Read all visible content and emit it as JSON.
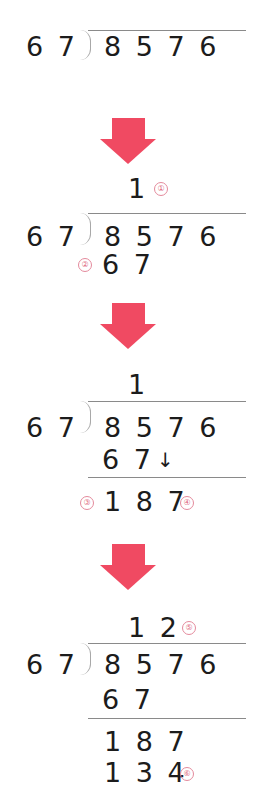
{
  "colors": {
    "arrow": "#f04a62",
    "marker": "#e06a82",
    "text": "#1c1c1c",
    "rule": "#8a8a8a"
  },
  "steps": [
    {
      "divisor": "6 7",
      "dividend": "8 5 7 6"
    },
    {
      "quotient": "1",
      "quotient_marker": "①",
      "divisor": "6 7",
      "dividend": "8 5 7 6",
      "product": "6 7",
      "product_marker": "②"
    },
    {
      "quotient": "1",
      "divisor": "6 7",
      "dividend": "8 5 7 6",
      "product": "6 7",
      "bring_down_icon": "↓",
      "remainder_marker": "③",
      "remainder": "1 8 7",
      "bring_down_marker": "④"
    },
    {
      "quotient": "1 2",
      "quotient_marker": "⑤",
      "divisor": "6 7",
      "dividend": "8 5 7 6",
      "product": "6 7",
      "remainder": "1 8 7",
      "product2": "1 3 4",
      "product2_marker": "⑥"
    }
  ],
  "arrows": [
    "down-arrow",
    "down-arrow",
    "down-arrow"
  ]
}
